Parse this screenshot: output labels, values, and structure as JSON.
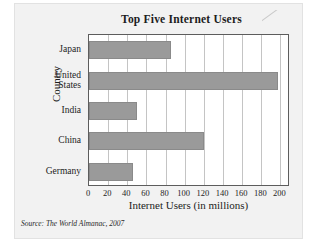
{
  "figure": {
    "title": "Top Five Internet Users",
    "source": "Source: The World Almanac, 2007",
    "bar_color": "#9a9a9a",
    "plot_background": "#ffffff",
    "card_background": "#f2f2f2",
    "frame_color": "#5d5d5d",
    "gridline_color": "#c4c4c4"
  },
  "chart_data": {
    "type": "bar",
    "orientation": "horizontal",
    "title": "Top Five Internet Users",
    "xlabel": "Internet Users (in millions)",
    "ylabel": "Country",
    "categories": [
      "Japan",
      "United States",
      "India",
      "China",
      "Germany"
    ],
    "values": [
      86,
      197,
      50,
      120,
      46
    ],
    "xlim": [
      0,
      210
    ],
    "xticks": [
      0,
      20,
      40,
      60,
      80,
      100,
      120,
      140,
      160,
      180,
      200
    ],
    "xtick_labels": [
      "0",
      "20",
      "40",
      "60",
      "80",
      "100",
      "120",
      "140",
      "160",
      "180",
      "200"
    ],
    "grid": "vertical",
    "legend": "none",
    "source": "Source: The World Almanac, 2007"
  }
}
